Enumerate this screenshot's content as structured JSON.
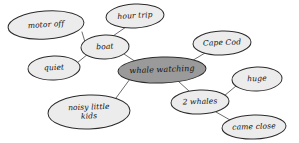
{
  "diagram": {
    "type": "concept-map",
    "style": {
      "background": "#ffffff",
      "node_fill": "#ececec",
      "node_fill_central": "#9a9a9a",
      "node_stroke": "#2b2b2b",
      "edge_stroke": "#5a5a5a",
      "text_color": "#111111"
    },
    "nodes": [
      {
        "id": "motor_off",
        "label": "motor off",
        "lines": [
          "motor off"
        ],
        "cx": 46,
        "cy": 25,
        "rx": 38,
        "ry": 14,
        "rotate": -4,
        "central": false
      },
      {
        "id": "hour_trip",
        "label": "hour trip",
        "lines": [
          "hour trip"
        ],
        "cx": 135,
        "cy": 16,
        "rx": 29,
        "ry": 12,
        "rotate": -3,
        "central": false
      },
      {
        "id": "boat",
        "label": "boat",
        "lines": [
          "boat"
        ],
        "cx": 105,
        "cy": 47,
        "rx": 24,
        "ry": 12,
        "rotate": -2,
        "central": false
      },
      {
        "id": "cape_cod",
        "label": "Cape Cod",
        "lines": [
          "Cape Cod"
        ],
        "cx": 222,
        "cy": 43,
        "rx": 29,
        "ry": 12,
        "rotate": -2,
        "central": false
      },
      {
        "id": "quiet",
        "label": "quiet",
        "lines": [
          "quiet"
        ],
        "cx": 54,
        "cy": 68,
        "rx": 26,
        "ry": 12,
        "rotate": -2,
        "central": false
      },
      {
        "id": "whale_watching",
        "label": "whale watching",
        "lines": [
          "whale watching"
        ],
        "cx": 162,
        "cy": 70,
        "rx": 44,
        "ry": 13,
        "rotate": -2,
        "central": true
      },
      {
        "id": "huge",
        "label": "huge",
        "lines": [
          "huge"
        ],
        "cx": 257,
        "cy": 79,
        "rx": 25,
        "ry": 12,
        "rotate": -2,
        "central": false
      },
      {
        "id": "two_whales",
        "label": "2 whales",
        "lines": [
          "2 whales"
        ],
        "cx": 200,
        "cy": 102,
        "rx": 29,
        "ry": 12,
        "rotate": -2,
        "central": false
      },
      {
        "id": "noisy_little_kids",
        "label": "noisy little kids",
        "lines": [
          "noisy little",
          "kids"
        ],
        "cx": 89,
        "cy": 112,
        "rx": 41,
        "ry": 17,
        "rotate": -2,
        "central": false
      },
      {
        "id": "came_close",
        "label": "came close",
        "lines": [
          "came close"
        ],
        "cx": 254,
        "cy": 127,
        "rx": 32,
        "ry": 12,
        "rotate": -2,
        "central": false
      }
    ],
    "edges": [
      {
        "id": "edge-motor-off-boat",
        "from": "motor_off",
        "to": "boat",
        "x1": 82,
        "y1": 32,
        "x2": 85,
        "y2": 42
      },
      {
        "id": "edge-hour-trip-boat",
        "from": "hour_trip",
        "to": "boat",
        "x1": 126,
        "y1": 27,
        "x2": 113,
        "y2": 36
      },
      {
        "id": "edge-quiet-boat",
        "from": "quiet",
        "to": "boat",
        "x1": 77,
        "y1": 63,
        "x2": 88,
        "y2": 54
      },
      {
        "id": "edge-boat-whale-watching",
        "from": "boat",
        "to": "whale_watching",
        "x1": 124,
        "y1": 54,
        "x2": 136,
        "y2": 62
      },
      {
        "id": "edge-cape-cod-whale-watching",
        "from": "cape_cod",
        "to": "whale_watching",
        "x1": 205,
        "y1": 53,
        "x2": 190,
        "y2": 62
      },
      {
        "id": "edge-whale-watching-noisy-kids",
        "from": "whale_watching",
        "to": "noisy_little_kids",
        "x1": 130,
        "y1": 79,
        "x2": 116,
        "y2": 98
      },
      {
        "id": "edge-whale-watching-two-whales",
        "from": "whale_watching",
        "to": "two_whales",
        "x1": 178,
        "y1": 81,
        "x2": 189,
        "y2": 91
      },
      {
        "id": "edge-two-whales-huge",
        "from": "two_whales",
        "to": "huge",
        "x1": 224,
        "y1": 96,
        "x2": 236,
        "y2": 86
      },
      {
        "id": "edge-two-whales-came-close",
        "from": "two_whales",
        "to": "came_close",
        "x1": 216,
        "y1": 112,
        "x2": 230,
        "y2": 120
      }
    ]
  }
}
